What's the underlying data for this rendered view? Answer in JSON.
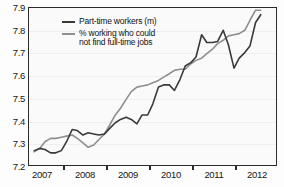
{
  "chart_data": {
    "type": "line",
    "title": "",
    "xlabel": "",
    "ylabel": "",
    "xlim": [
      2006.5,
      2012.2
    ],
    "ylim": [
      7.2,
      7.9
    ],
    "grid": true,
    "legend_position": "top-left",
    "xticks": [
      "2007",
      "2008",
      "2009",
      "2010",
      "2011",
      "2012"
    ],
    "yticks": [
      "7.2",
      "7.3",
      "7.4",
      "7.5",
      "7.6",
      "7.7",
      "7.8",
      "7.9"
    ],
    "colors": {
      "part_time_workers": "#3a3a3a",
      "pct_not_find_full_time": "#8f8f8f",
      "axis": "#2b2b2b",
      "grid": "#efefef",
      "background": "#fafafa"
    },
    "x": [
      2006.62,
      2006.75,
      2006.87,
      2007.0,
      2007.12,
      2007.25,
      2007.37,
      2007.5,
      2007.62,
      2007.75,
      2007.87,
      2008.0,
      2008.12,
      2008.25,
      2008.37,
      2008.5,
      2008.62,
      2008.75,
      2008.87,
      2009.0,
      2009.12,
      2009.25,
      2009.37,
      2009.5,
      2009.62,
      2009.75,
      2009.87,
      2010.0,
      2010.12,
      2010.25,
      2010.37,
      2010.5,
      2010.62,
      2010.75,
      2010.87,
      2011.0,
      2011.12,
      2011.25,
      2011.37,
      2011.5,
      2011.62,
      2011.75,
      2011.87
    ],
    "series": [
      {
        "name": "Part-time workers (m)",
        "label": "Part-time workers (m)",
        "color": "#3a3a3a",
        "values": [
          7.26,
          7.27,
          7.265,
          7.25,
          7.25,
          7.26,
          7.3,
          7.355,
          7.35,
          7.33,
          7.34,
          7.335,
          7.33,
          7.335,
          7.36,
          7.385,
          7.4,
          7.41,
          7.4,
          7.38,
          7.42,
          7.42,
          7.47,
          7.545,
          7.555,
          7.555,
          7.53,
          7.58,
          7.64,
          7.655,
          7.68,
          7.78,
          7.745,
          7.745,
          7.75,
          7.8,
          7.735,
          7.63,
          7.675,
          7.7,
          7.73,
          7.835,
          7.87
        ]
      },
      {
        "name": "% working who could not find full-time jobs",
        "label": "% working who could\nnot find full-time jobs",
        "color": "#8f8f8f",
        "values": [
          7.255,
          7.27,
          7.3,
          7.315,
          7.315,
          7.32,
          7.325,
          7.33,
          7.315,
          7.295,
          7.275,
          7.285,
          7.31,
          7.335,
          7.375,
          7.42,
          7.45,
          7.49,
          7.525,
          7.545,
          7.55,
          7.555,
          7.565,
          7.575,
          7.59,
          7.605,
          7.62,
          7.625,
          7.625,
          7.65,
          7.665,
          7.675,
          7.695,
          7.715,
          7.74,
          7.755,
          7.775,
          7.78,
          7.785,
          7.8,
          7.845,
          7.89,
          7.89
        ]
      }
    ]
  },
  "legend": {
    "items": [
      {
        "label": "Part-time workers (m)",
        "color": "#3a3a3a"
      },
      {
        "label": "% working who could\nnot find full-time jobs",
        "color": "#8f8f8f"
      }
    ]
  },
  "axes": {
    "y_tick_labels": [
      "7.9",
      "7.8",
      "7.7",
      "7.6",
      "7.5",
      "7.4",
      "7.3",
      "7.2"
    ],
    "x_tick_labels": [
      "2007",
      "2008",
      "2009",
      "2010",
      "2011",
      "2012"
    ]
  }
}
